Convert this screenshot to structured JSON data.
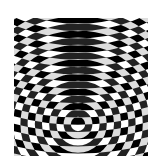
{
  "image": {
    "description": "Moire interference pattern of two sets of concentric rings",
    "colors": {
      "dark": "#222222",
      "light": "#ffffff"
    },
    "region": {
      "x": 14,
      "y": 18,
      "width": 134,
      "height": 138
    },
    "ring_center_a": {
      "x": 78,
      "y": 124
    },
    "ring_center_b": {
      "x": 78,
      "y": -120
    },
    "ring_spacing_a": 7.2,
    "ring_spacing_b": 7.2
  }
}
